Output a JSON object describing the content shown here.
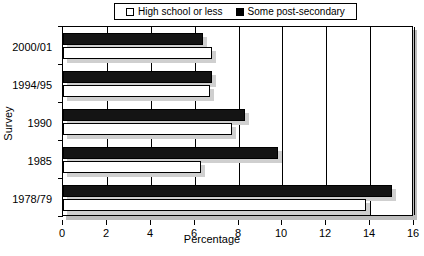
{
  "chart_data": {
    "type": "bar",
    "orientation": "horizontal",
    "title": "",
    "xlabel": "Percentage",
    "ylabel": "Survey",
    "xlim": [
      0,
      16
    ],
    "xticks": [
      0,
      2,
      4,
      6,
      8,
      10,
      12,
      14,
      16
    ],
    "xtick_labels": [
      "0",
      "2",
      "4",
      "6",
      "8",
      "10",
      "12",
      "14",
      "16"
    ],
    "grid": true,
    "legend_position": "top",
    "categories": [
      "1978/79",
      "1985",
      "1990",
      "1994/95",
      "2000/01"
    ],
    "series": [
      {
        "name": "High school or less",
        "style": "open",
        "color": "#ffffff",
        "values": [
          13.8,
          6.3,
          7.7,
          6.7,
          6.8
        ]
      },
      {
        "name": "Some post-secondary",
        "style": "filled",
        "color": "#000000",
        "values": [
          15.0,
          9.8,
          8.3,
          6.8,
          6.4
        ]
      }
    ]
  },
  "legend": {
    "entries": [
      {
        "label": "High school or less",
        "swatch": "open-square-icon"
      },
      {
        "label": "Some post-secondary",
        "swatch": "filled-square-icon"
      }
    ]
  },
  "axes": {
    "x_title": "Percentage",
    "y_title": "Survey",
    "x_tick_labels": [
      "0",
      "2",
      "4",
      "6",
      "8",
      "10",
      "12",
      "14",
      "16"
    ],
    "y_tick_labels": [
      "2000/01",
      "1994/95",
      "1990",
      "1985",
      "1978/79"
    ]
  }
}
